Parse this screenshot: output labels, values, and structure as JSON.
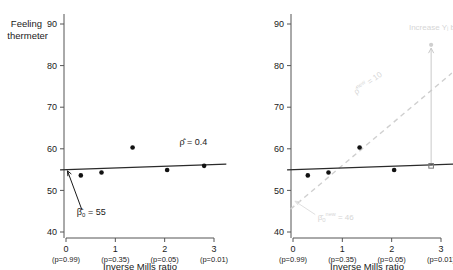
{
  "figure": {
    "background": "#ffffff",
    "panel_count": 2
  },
  "chart_data": [
    {
      "id": "left-panel",
      "type": "scatter",
      "title": "",
      "xlabel": "Inverse Mills ratio",
      "ylabel": "Feeling thermeter",
      "ylabel_line1": "Feeling",
      "ylabel_line2": "thermeter",
      "xlim": [
        -0.25,
        3.25
      ],
      "ylim": [
        38,
        92
      ],
      "grid": false,
      "legend": "none",
      "yticks": [
        40,
        50,
        60,
        70,
        80,
        90
      ],
      "ytick_labels": [
        "40",
        "50",
        "60",
        "70",
        "80",
        "90"
      ],
      "xticks": [
        0,
        1,
        2,
        3
      ],
      "xtick_labels": [
        "0",
        "1",
        "2",
        "3"
      ],
      "xtick_sublabels": [
        "(p=0.99)",
        "(p=0.35)",
        "(p=0.05)",
        "(p=0.01)"
      ],
      "points": [
        {
          "x": 0.3,
          "y": 53.6
        },
        {
          "x": 0.72,
          "y": 54.3
        },
        {
          "x": 1.35,
          "y": 60.3
        },
        {
          "x": 2.05,
          "y": 54.9
        },
        {
          "x": 2.8,
          "y": 55.9
        }
      ],
      "fit_line": {
        "intercept": 55.0,
        "slope": 0.4,
        "x_start": -0.12,
        "x_end": 3.25,
        "color": "#2b2b2b"
      },
      "annotations": [
        {
          "name": "rho-hat-label",
          "text": "ρ̂ = 0.4",
          "x": 2.3,
          "y": 61.0
        },
        {
          "name": "beta0-hat-label",
          "text_pre": "β̂",
          "text_sub": "0",
          "text_post": " = 55",
          "full_text": "β̂0 = 55",
          "x": 0.22,
          "y": 44.2
        }
      ],
      "arrow": {
        "name": "beta0-arrow",
        "from_x": 0.32,
        "from_y": 45.4,
        "to_x": 0.03,
        "to_y": 54.7,
        "color": "#1a1a1a"
      }
    },
    {
      "id": "right-panel",
      "type": "scatter",
      "title": "",
      "xlabel": "Inverse Mills ratio",
      "ylabel": "",
      "xlim": [
        -0.25,
        3.25
      ],
      "ylim": [
        38,
        92
      ],
      "grid": false,
      "legend": "none",
      "yticks": [
        40,
        50,
        60,
        70,
        80,
        90
      ],
      "ytick_labels": [
        "40",
        "50",
        "60",
        "70",
        "80",
        "90"
      ],
      "xticks": [
        0,
        1,
        2,
        3
      ],
      "xtick_labels": [
        "0",
        "1",
        "2",
        "3"
      ],
      "xtick_sublabels": [
        "(p=0.99)",
        "(p=0.35)",
        "(p=0.05)",
        "(p=0.01)"
      ],
      "points": [
        {
          "x": 0.3,
          "y": 53.6
        },
        {
          "x": 0.72,
          "y": 54.3
        },
        {
          "x": 1.35,
          "y": 60.3
        },
        {
          "x": 2.05,
          "y": 54.9
        }
      ],
      "open_point": {
        "x": 2.8,
        "y": 55.9,
        "marker": "open-square"
      },
      "shifted_point": {
        "x": 2.8,
        "y": 85.0,
        "marker": "ghost-dot"
      },
      "fit_line": {
        "intercept": 55.0,
        "slope": 0.4,
        "x_start": -0.12,
        "x_end": 3.25,
        "color": "#2b2b2b"
      },
      "new_fit_line": {
        "name": "new-regression-dashed",
        "intercept": 46.0,
        "slope": 10.0,
        "x_start": -0.05,
        "x_end": 3.22,
        "color": "#cfcfcf",
        "dashed": true
      },
      "vertical_shift_arrow": {
        "name": "increase-arrow",
        "x": 2.8,
        "from_y": 55.9,
        "to_y": 84.2,
        "color": "#c9c9c9"
      },
      "annotations": [
        {
          "name": "increase-label",
          "text": "Increase Yᵢ by 30",
          "x": 2.35,
          "y": 88.5,
          "color": "#d9d9d9"
        },
        {
          "name": "new-rho-label",
          "full_text": "ρ̂ⁿᵉʷ = 10",
          "text_pre": "ρ̂",
          "text_sup": "new",
          "text_post": " = 10",
          "x": 1.28,
          "y": 73.0,
          "rotation": -36,
          "color": "#e0e0e0"
        },
        {
          "name": "new-beta0-label",
          "full_text": "β̂₀ⁿᵉʷ = 46",
          "text_pre": "β̂",
          "text_sub": "0",
          "text_sup": "new",
          "text_post": " = 46",
          "x": 0.5,
          "y": 43.0,
          "color": "#e3e3e3"
        }
      ],
      "ghost_arrow": {
        "name": "new-beta0-arrow",
        "from_x": 0.45,
        "from_y": 44.2,
        "to_x": 0.04,
        "to_y": 47.4,
        "color": "#e0e0e0"
      }
    }
  ]
}
